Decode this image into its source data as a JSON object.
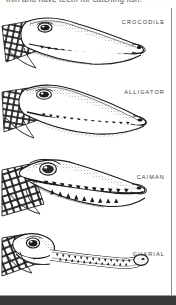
{
  "caption": {
    "text": "thin and have teeth for catching fish."
  },
  "figure": {
    "kind": "line-illustration",
    "style": "pen-and-ink stipple engraving",
    "background_color": "#ffffff",
    "ink_color": "#1b1b1b",
    "border_color": "#8d8d8d",
    "scan_band_color": "#3a3a3a",
    "panel_count": 4
  },
  "panels": [
    {
      "label": "CROCODILE",
      "snout": "tapered V-shaped snout, fourth lower tooth visible outside closed jaw",
      "orientation": "facing right"
    },
    {
      "label": "ALLIGATOR",
      "snout": "broad rounded U-shaped snout, lower teeth hidden when jaw closed",
      "orientation": "facing right"
    },
    {
      "label": "CAIMAN",
      "snout": "short broad snout, open jaws showing teeth, bony eyelid ridge",
      "orientation": "facing right"
    },
    {
      "label": "GHARIAL",
      "snout": "very long narrow snout with bulbous tip and interlocking needle teeth",
      "orientation": "facing right"
    }
  ]
}
